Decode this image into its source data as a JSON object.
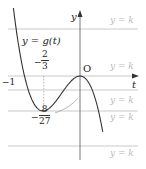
{
  "labels": {
    "y_axis": "y",
    "t_axis": "t",
    "origin": "O",
    "function": "y = g(t)",
    "neg_one": "−1",
    "yk": "y = k",
    "frac_23_num": "2",
    "frac_23_den": "3",
    "frac_827_num": "8",
    "frac_827_den": "27",
    "minus": "−"
  },
  "k_lines_y": [
    29,
    90,
    111,
    146
  ],
  "colors": {
    "curve": "#333333",
    "axis": "#333333",
    "kline": "#bbbbbb"
  }
}
